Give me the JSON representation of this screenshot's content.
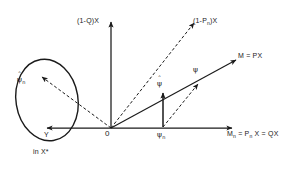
{
  "figure": {
    "type": "vector-space-diagram",
    "background_color": "#ffffff",
    "stroke_color": "#1a1a1a",
    "width": 301,
    "height": 169
  },
  "axes": {
    "vertical_label": "(1-Q)X",
    "horizontal_label_parts": {
      "m": "M",
      "m_sub": "n",
      "eq1": " = P",
      "p_sub": "n",
      "rest": " X = QX"
    },
    "horizontal_label_text": "Mn = Pn X = QX",
    "origin_label": "0"
  },
  "rays": {
    "dashed_upper_right_label_parts": {
      "lead": "(1-P",
      "sub": "n",
      "tail": ")X"
    },
    "dashed_upper_right_label_text": "(1-Pn)X",
    "solid_right_label": "M = PX"
  },
  "labels": {
    "psi_hat_ellipse": {
      "glyph": "ψ",
      "hat": "ˆ",
      "sub": "n"
    },
    "psi_hat_vertical": {
      "glyph": "ψ",
      "hat": "ˆ",
      "sub": ""
    },
    "psi_diagonal": {
      "glyph": "ψ",
      "hat": "",
      "sub": ""
    },
    "psi_axis_point": {
      "glyph": "ψ",
      "hat": "",
      "sub": "n"
    },
    "y_label": "Y",
    "ellipse_caption": "in X*"
  }
}
